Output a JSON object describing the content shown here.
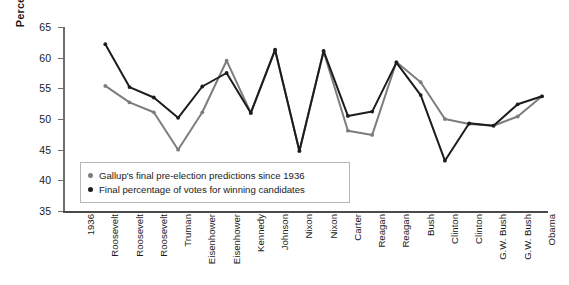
{
  "chart_data": {
    "type": "line",
    "title": "",
    "xlabel": "",
    "ylabel": "Percentage",
    "ylim": [
      35,
      65
    ],
    "yticks": [
      35,
      40,
      45,
      50,
      55,
      60,
      65
    ],
    "grid": false,
    "legend_position": "inside-lower-left",
    "categories": [
      "1936",
      "Roosevelt",
      "Roosevelt",
      "Roosevelt",
      "Truman",
      "Eisenhower",
      "Eisenhower",
      "Kennedy",
      "Johnson",
      "Nixon",
      "Nixon",
      "Carter",
      "Reagan",
      "Reagan",
      "Bush",
      "Clinton",
      "Clinton",
      "G.W. Bush",
      "G.W. Bush",
      "Obama"
    ],
    "series": [
      {
        "name": "Gallup's final pre-election predictions since 1936",
        "color": "#7d7d7d",
        "values": [
          null,
          55.4,
          52.7,
          51.1,
          45.0,
          51.1,
          59.5,
          51.0,
          61.2,
          44.8,
          61.0,
          48.1,
          47.4,
          59.3,
          56.0,
          50.0,
          49.2,
          48.9,
          50.4,
          53.7
        ]
      },
      {
        "name": "Final percentage of votes for winning candidates",
        "color": "#1c1c1c",
        "values": [
          null,
          62.2,
          55.2,
          53.5,
          50.2,
          55.3,
          57.5,
          51.0,
          61.3,
          44.8,
          61.1,
          50.5,
          51.2,
          59.2,
          53.9,
          43.2,
          49.3,
          48.9,
          52.4,
          53.7
        ]
      }
    ]
  },
  "legend": {
    "items": [
      {
        "label": "Gallup's final pre-election predictions since 1936",
        "color": "#7d7d7d"
      },
      {
        "label": "Final percentage of votes for winning candidates",
        "color": "#1c1c1c"
      }
    ]
  }
}
